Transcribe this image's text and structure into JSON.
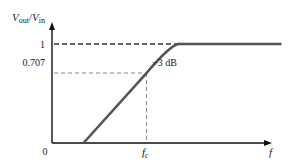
{
  "chart_data": {
    "type": "line",
    "title": "",
    "ylabel": {
      "main": "V",
      "sub1": "out",
      "sep": "/",
      "main2": "V",
      "sub2": "in"
    },
    "xlabel": "f",
    "origin_label": "0",
    "ylim": [
      0,
      1
    ],
    "y_ticks": [
      {
        "value": 1,
        "label": "1",
        "style": "dashed-dark"
      },
      {
        "value": 0.707,
        "label": "0.707",
        "style": "dashed-light"
      }
    ],
    "x_ticks": [
      {
        "value": "fc",
        "label_main": "f",
        "label_sub": "c",
        "style": "dashed-light"
      }
    ],
    "annotation": {
      "text": "−3 dB",
      "at": {
        "x": "fc",
        "y": 0.707
      }
    },
    "series": [
      {
        "name": "Ideal high-pass response",
        "description": "Rises linearly from zero to 0.707 at fc, then curves smoothly to a flat value of 1",
        "points": [
          {
            "x": 0.14,
            "y": 0.0
          },
          {
            "x": 0.42,
            "y": 0.707
          },
          {
            "x": 0.52,
            "y": 0.93
          },
          {
            "x": 0.57,
            "y": 1.0
          },
          {
            "x": 1.02,
            "y": 1.0
          }
        ]
      }
    ],
    "fc_x": 0.42,
    "colors": {
      "axis": "#111111",
      "curve": "#555555",
      "dash_dark": "#333333",
      "dash_light": "#8a8a8a"
    }
  }
}
